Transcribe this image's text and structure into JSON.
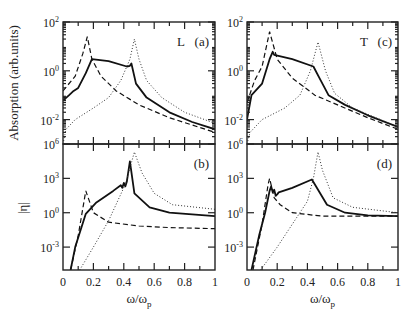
{
  "figure": {
    "xlabel": "ω/ω",
    "xlabel_sub": "p",
    "ylabel_top": "Absorption (arb.units)",
    "ylabel_bottom": "|η|",
    "xticks": [
      "0",
      "0.2",
      "0.4",
      "0.6",
      "0.8",
      "1"
    ],
    "colors": {
      "line": "#111111",
      "frame": "#222222",
      "background": "#ffffff"
    }
  },
  "chart_data": [
    {
      "panel": "(a)",
      "tag": "L",
      "type": "line",
      "yscale": "log",
      "ylabel": "Absorption (arb.units)",
      "xlabel": "",
      "xlim": [
        0,
        1
      ],
      "ylim": [
        0.001,
        100
      ],
      "yticks": [
        "10^2",
        "10^0",
        "10^-2"
      ],
      "series": [
        {
          "name": "solid",
          "style": "solid",
          "x": [
            0.0,
            0.04,
            0.07,
            0.1,
            0.15,
            0.19,
            0.3,
            0.42,
            0.44,
            0.45,
            0.48,
            0.55,
            0.7,
            0.85,
            1.0
          ],
          "y": [
            0.06,
            0.1,
            0.15,
            0.2,
            0.8,
            3.0,
            2.5,
            1.5,
            1.6,
            2.0,
            0.3,
            0.08,
            0.02,
            0.008,
            0.004
          ]
        },
        {
          "name": "dashed",
          "style": "dashed",
          "x": [
            0.0,
            0.08,
            0.13,
            0.16,
            0.19,
            0.25,
            0.35,
            0.5,
            0.7,
            1.0
          ],
          "y": [
            0.15,
            0.6,
            5.0,
            25.0,
            3.0,
            0.6,
            0.15,
            0.04,
            0.012,
            0.003
          ]
        },
        {
          "name": "dotted",
          "style": "dotted",
          "x": [
            0.0,
            0.02,
            0.08,
            0.2,
            0.3,
            0.38,
            0.44,
            0.47,
            0.5,
            0.55,
            0.65,
            0.8,
            1.0
          ],
          "y": [
            0.001,
            0.004,
            0.01,
            0.03,
            0.08,
            0.4,
            3.0,
            20.0,
            3.0,
            0.4,
            0.08,
            0.02,
            0.007
          ]
        }
      ]
    },
    {
      "panel": "(b)",
      "tag": "",
      "type": "line",
      "yscale": "log",
      "ylabel": "|η|",
      "xlabel": "ω/ωp",
      "xlim": [
        0,
        1
      ],
      "ylim": [
        1e-05,
        1000000
      ],
      "yticks": [
        "10^6",
        "10^3",
        "10^0",
        "10^-3"
      ],
      "series": [
        {
          "name": "solid",
          "style": "solid",
          "x": [
            0.05,
            0.08,
            0.15,
            0.22,
            0.33,
            0.38,
            0.39,
            0.4,
            0.41,
            0.42,
            0.44,
            0.47,
            0.57,
            0.7,
            1.0
          ],
          "y": [
            1e-05,
            0.001,
            0.8,
            8,
            80,
            250,
            150,
            400,
            200,
            500,
            30000,
            50,
            3,
            1.0,
            0.5
          ]
        },
        {
          "name": "dashed",
          "style": "dashed",
          "x": [
            0.05,
            0.1,
            0.15,
            0.2,
            0.3,
            0.5,
            0.7,
            1.0
          ],
          "y": [
            1e-05,
            0.01,
            80,
            1.0,
            0.15,
            0.07,
            0.05,
            0.04
          ]
        },
        {
          "name": "dotted",
          "style": "dotted",
          "x": [
            0.11,
            0.2,
            0.3,
            0.41,
            0.47,
            0.52,
            0.6,
            0.72,
            1.0
          ],
          "y": [
            1e-05,
            0.001,
            0.2,
            300,
            200000,
            3000,
            50,
            5,
            2
          ]
        }
      ]
    },
    {
      "panel": "(c)",
      "tag": "T",
      "type": "line",
      "yscale": "log",
      "ylabel": "",
      "xlabel": "",
      "xlim": [
        0,
        1
      ],
      "ylim": [
        0.001,
        100
      ],
      "yticks": [
        "10^2",
        "10^0",
        "10^-2"
      ],
      "series": [
        {
          "name": "solid",
          "style": "solid",
          "x": [
            0.0,
            0.03,
            0.1,
            0.15,
            0.17,
            0.18,
            0.3,
            0.44,
            0.48,
            0.54,
            0.65,
            0.8,
            1.0
          ],
          "y": [
            0.01,
            0.1,
            0.3,
            3.0,
            6.0,
            4.5,
            3.0,
            1.5,
            0.5,
            0.1,
            0.04,
            0.015,
            0.005
          ]
        },
        {
          "name": "dashed",
          "style": "dashed",
          "x": [
            0.0,
            0.05,
            0.1,
            0.15,
            0.2,
            0.3,
            0.45,
            0.6,
            0.8,
            1.0
          ],
          "y": [
            0.05,
            0.4,
            1.5,
            40.0,
            3.0,
            0.5,
            0.1,
            0.04,
            0.012,
            0.004
          ]
        },
        {
          "name": "dotted",
          "style": "dotted",
          "x": [
            0.0,
            0.02,
            0.1,
            0.25,
            0.35,
            0.42,
            0.47,
            0.52,
            0.58,
            0.7,
            1.0
          ],
          "y": [
            0.001,
            0.003,
            0.01,
            0.03,
            0.1,
            1.0,
            15.0,
            1.0,
            0.12,
            0.03,
            0.005
          ]
        }
      ]
    },
    {
      "panel": "(d)",
      "tag": "",
      "type": "line",
      "yscale": "log",
      "ylabel": "",
      "xlabel": "ω/ωp",
      "xlim": [
        0,
        1
      ],
      "ylim": [
        1e-05,
        1000000
      ],
      "yticks": [
        "10^6",
        "10^3",
        "10^0",
        "10^-3"
      ],
      "series": [
        {
          "name": "solid",
          "style": "solid",
          "x": [
            0.03,
            0.08,
            0.12,
            0.15,
            0.16,
            0.17,
            0.18,
            0.19,
            0.2,
            0.21,
            0.3,
            0.43,
            0.53,
            0.65,
            0.8,
            1.0
          ],
          "y": [
            1e-05,
            0.01,
            1.0,
            80,
            200,
            60,
            100,
            30,
            40,
            60,
            150,
            800,
            5,
            1.0,
            0.6,
            0.5
          ]
        },
        {
          "name": "dashed",
          "style": "dashed",
          "x": [
            0.04,
            0.1,
            0.14,
            0.15,
            0.18,
            0.22,
            0.3,
            0.5,
            0.7,
            1.0
          ],
          "y": [
            1e-05,
            0.1,
            300,
            1000,
            20,
            5,
            1.0,
            0.5,
            0.5,
            0.5
          ]
        },
        {
          "name": "dotted",
          "style": "dotted",
          "x": [
            0.09,
            0.2,
            0.3,
            0.4,
            0.44,
            0.47,
            0.5,
            0.57,
            0.7,
            1.0
          ],
          "y": [
            1e-05,
            0.001,
            0.1,
            10,
            1000,
            200000,
            5000,
            20,
            3,
            1.0
          ]
        }
      ]
    }
  ]
}
